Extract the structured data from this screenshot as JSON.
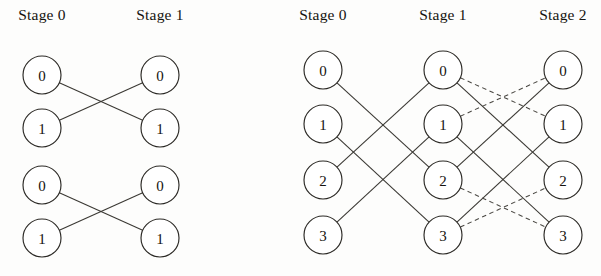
{
  "figure": {
    "title": "",
    "background_color": "#fdfdfc",
    "line_color": "#3a3833",
    "node_fill": "#ffffff",
    "node_stroke": "#2c2a26",
    "text_color": "#15130f"
  },
  "diagrams": [
    {
      "id": "left-diagram",
      "name": "two-stage-butterfly-network",
      "stage_labels": [
        {
          "text": "Stage 0",
          "x": 42,
          "y": 20
        },
        {
          "text": "Stage 1",
          "x": 160,
          "y": 20
        }
      ],
      "node_radius": 19,
      "columns": [
        {
          "stage": "Stage 0",
          "x": 42,
          "nodes": [
            {
              "label": "0",
              "y": 75
            },
            {
              "label": "1",
              "y": 128
            },
            {
              "label": "0",
              "y": 185
            },
            {
              "label": "1",
              "y": 238
            }
          ]
        },
        {
          "stage": "Stage 1",
          "x": 160,
          "nodes": [
            {
              "label": "0",
              "y": 75
            },
            {
              "label": "1",
              "y": 128
            },
            {
              "label": "0",
              "y": 185
            },
            {
              "label": "1",
              "y": 238
            }
          ]
        }
      ],
      "edges": [
        {
          "from": [
            42,
            75
          ],
          "to": [
            160,
            128
          ],
          "style": "solid"
        },
        {
          "from": [
            42,
            128
          ],
          "to": [
            160,
            75
          ],
          "style": "solid"
        },
        {
          "from": [
            42,
            185
          ],
          "to": [
            160,
            238
          ],
          "style": "solid"
        },
        {
          "from": [
            42,
            238
          ],
          "to": [
            160,
            185
          ],
          "style": "solid"
        }
      ]
    },
    {
      "id": "right-diagram",
      "name": "three-stage-butterfly-network",
      "stage_labels": [
        {
          "text": "Stage 0",
          "x": 323,
          "y": 20
        },
        {
          "text": "Stage 1",
          "x": 443,
          "y": 20
        },
        {
          "text": "Stage 2",
          "x": 563,
          "y": 20
        }
      ],
      "node_radius": 19,
      "center_crossing": {
        "x": 498,
        "y": 153
      },
      "columns": [
        {
          "stage": "Stage 0",
          "x": 323,
          "nodes": [
            {
              "label": "0",
              "y": 70
            },
            {
              "label": "1",
              "y": 124
            },
            {
              "label": "2",
              "y": 180
            },
            {
              "label": "3",
              "y": 235
            }
          ]
        },
        {
          "stage": "Stage 1",
          "x": 443,
          "nodes": [
            {
              "label": "0",
              "y": 70
            },
            {
              "label": "1",
              "y": 124
            },
            {
              "label": "2",
              "y": 180
            },
            {
              "label": "3",
              "y": 235
            }
          ]
        },
        {
          "stage": "Stage 2",
          "x": 563,
          "nodes": [
            {
              "label": "0",
              "y": 70
            },
            {
              "label": "1",
              "y": 124
            },
            {
              "label": "2",
              "y": 180
            },
            {
              "label": "3",
              "y": 235
            }
          ]
        }
      ],
      "edges": [
        {
          "from": [
            323,
            70
          ],
          "to": [
            443,
            180
          ],
          "style": "solid"
        },
        {
          "from": [
            323,
            124
          ],
          "to": [
            443,
            235
          ],
          "style": "solid"
        },
        {
          "from": [
            323,
            180
          ],
          "to": [
            443,
            70
          ],
          "style": "solid"
        },
        {
          "from": [
            323,
            235
          ],
          "to": [
            443,
            124
          ],
          "style": "solid"
        },
        {
          "from": [
            443,
            70
          ],
          "to": [
            563,
            180
          ],
          "style": "solid"
        },
        {
          "from": [
            443,
            124
          ],
          "to": [
            563,
            235
          ],
          "style": "solid"
        },
        {
          "from": [
            443,
            180
          ],
          "to": [
            563,
            70
          ],
          "style": "solid"
        },
        {
          "from": [
            443,
            235
          ],
          "to": [
            563,
            124
          ],
          "style": "solid"
        },
        {
          "from": [
            443,
            70
          ],
          "to": [
            563,
            124
          ],
          "style": "dashed"
        },
        {
          "from": [
            443,
            124
          ],
          "to": [
            563,
            70
          ],
          "style": "dashed"
        },
        {
          "from": [
            443,
            180
          ],
          "to": [
            563,
            235
          ],
          "style": "dashed"
        },
        {
          "from": [
            443,
            235
          ],
          "to": [
            563,
            180
          ],
          "style": "dashed"
        }
      ]
    }
  ],
  "legend": {
    "solid_meaning": "straight/cross connection",
    "dashed_meaning": "alternate connection"
  }
}
